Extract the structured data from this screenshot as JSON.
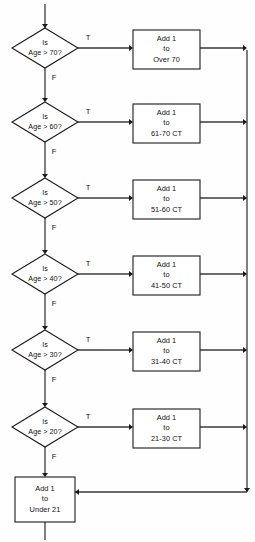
{
  "diagram": {
    "type": "flowchart",
    "background_color": "#fefefe",
    "line_color": "#3a3a3a",
    "shape_fill": "#ffffff",
    "shape_stroke": "#1a1a1a",
    "text_color": "#111111",
    "entry_arrow": {
      "name": "entry-arrow",
      "from_y": 4,
      "to_y": 28,
      "x": 45
    },
    "exit_arrow": {
      "name": "exit-arrow",
      "from_y": 522,
      "to_y": 540,
      "x": 45
    },
    "bus": {
      "name": "right-merge-bus",
      "x": 247,
      "top_y": 50,
      "bottom_y": 492,
      "turn_y": 492,
      "turn_to_x": 75
    },
    "branch_labels": {
      "true": "T",
      "false": "F"
    },
    "rows": [
      {
        "id": "row-70",
        "decision": {
          "name": "decision-age-over-70",
          "line1": "Is",
          "line2": "Age > 70?",
          "cx": 45,
          "cy": 48,
          "rx": 33,
          "ry": 20
        },
        "process": {
          "name": "process-add-over-70",
          "line1": "Add 1",
          "line2": "to",
          "line3": "Over 70",
          "x": 133,
          "y": 30,
          "w": 67,
          "h": 39
        },
        "true_label_x": 88,
        "true_label_y": 38,
        "false_label_x": 54,
        "false_label_y": 78
      },
      {
        "id": "row-60",
        "decision": {
          "name": "decision-age-over-60",
          "line1": "Is",
          "line2": "Age > 60?",
          "cx": 45,
          "cy": 122,
          "rx": 33,
          "ry": 20
        },
        "process": {
          "name": "process-add-61-70",
          "line1": "Add 1",
          "line2": "to",
          "line3": "61-70  CT",
          "x": 133,
          "y": 104,
          "w": 67,
          "h": 39
        },
        "true_label_x": 88,
        "true_label_y": 112,
        "false_label_x": 54,
        "false_label_y": 152
      },
      {
        "id": "row-50",
        "decision": {
          "name": "decision-age-over-50",
          "line1": "Is",
          "line2": "Age > 50?",
          "cx": 45,
          "cy": 198,
          "rx": 33,
          "ry": 20
        },
        "process": {
          "name": "process-add-51-60",
          "line1": "Add 1",
          "line2": "to",
          "line3": "51-60 CT",
          "x": 133,
          "y": 180,
          "w": 67,
          "h": 39
        },
        "true_label_x": 88,
        "true_label_y": 188,
        "false_label_x": 54,
        "false_label_y": 228
      },
      {
        "id": "row-40",
        "decision": {
          "name": "decision-age-over-40",
          "line1": "Is",
          "line2": "Age > 40?",
          "cx": 45,
          "cy": 274,
          "rx": 33,
          "ry": 20
        },
        "process": {
          "name": "process-add-41-50",
          "line1": "Add 1",
          "line2": "to",
          "line3": "41-50 CT",
          "x": 133,
          "y": 256,
          "w": 67,
          "h": 39
        },
        "true_label_x": 88,
        "true_label_y": 264,
        "false_label_x": 54,
        "false_label_y": 304
      },
      {
        "id": "row-30",
        "decision": {
          "name": "decision-age-over-30",
          "line1": "Is",
          "line2": "Age > 30?",
          "cx": 45,
          "cy": 350,
          "rx": 33,
          "ry": 20
        },
        "process": {
          "name": "process-add-31-40",
          "line1": "Add 1",
          "line2": "to",
          "line3": "31-40 CT",
          "x": 133,
          "y": 332,
          "w": 67,
          "h": 39
        },
        "true_label_x": 88,
        "true_label_y": 340,
        "false_label_x": 54,
        "false_label_y": 380
      },
      {
        "id": "row-20",
        "decision": {
          "name": "decision-age-over-20",
          "line1": "Is",
          "line2": "Age > 20?",
          "cx": 45,
          "cy": 427,
          "rx": 33,
          "ry": 20
        },
        "process": {
          "name": "process-add-21-30",
          "line1": "Add 1",
          "line2": "to",
          "line3": "21-30 CT",
          "x": 133,
          "y": 409,
          "w": 67,
          "h": 39
        },
        "true_label_x": 88,
        "true_label_y": 417,
        "false_label_x": 54,
        "false_label_y": 457
      }
    ],
    "final_process": {
      "name": "process-add-under-21",
      "line1": "Add 1",
      "line2": "to",
      "line3": "Under 21",
      "x": 15,
      "y": 477,
      "w": 60,
      "h": 45,
      "cx": 45
    }
  }
}
